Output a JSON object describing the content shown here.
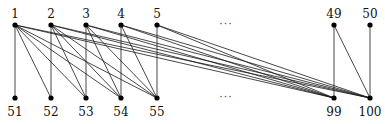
{
  "diagram": {
    "type": "bipartite-graph",
    "colors": {
      "edge": "#1a1a1a",
      "node": "#000000",
      "label": "#111111"
    },
    "node_radius": 2.6,
    "top_row": {
      "label_y": 18,
      "node_y": 25,
      "nodes": [
        {
          "id": "1",
          "label": "1",
          "x": 15
        },
        {
          "id": "2",
          "label": "2",
          "x": 51
        },
        {
          "id": "3",
          "label": "3",
          "x": 86
        },
        {
          "id": "4",
          "label": "4",
          "x": 121
        },
        {
          "id": "5",
          "label": "5",
          "x": 157
        },
        {
          "id": "49",
          "label": "49",
          "x": 334
        },
        {
          "id": "50",
          "label": "50",
          "x": 370
        }
      ]
    },
    "bottom_row": {
      "label_y": 116,
      "node_y": 98,
      "nodes": [
        {
          "id": "51",
          "label": "51",
          "x": 15
        },
        {
          "id": "52",
          "label": "52",
          "x": 51
        },
        {
          "id": "53",
          "label": "53",
          "x": 86
        },
        {
          "id": "54",
          "label": "54",
          "x": 121
        },
        {
          "id": "55",
          "label": "55",
          "x": 157
        },
        {
          "id": "99",
          "label": "99",
          "x": 334
        },
        {
          "id": "100",
          "label": "100",
          "x": 370
        }
      ]
    },
    "ellipses": [
      {
        "text": "···",
        "x": 226,
        "y": 28
      },
      {
        "text": "···",
        "x": 226,
        "y": 101
      }
    ],
    "edges": [
      [
        "1",
        "51"
      ],
      [
        "1",
        "52"
      ],
      [
        "1",
        "53"
      ],
      [
        "1",
        "54"
      ],
      [
        "1",
        "55"
      ],
      [
        "1",
        "99"
      ],
      [
        "1",
        "100"
      ],
      [
        "2",
        "52"
      ],
      [
        "2",
        "53"
      ],
      [
        "2",
        "54"
      ],
      [
        "2",
        "55"
      ],
      [
        "2",
        "99"
      ],
      [
        "2",
        "100"
      ],
      [
        "3",
        "53"
      ],
      [
        "3",
        "54"
      ],
      [
        "3",
        "55"
      ],
      [
        "3",
        "99"
      ],
      [
        "3",
        "100"
      ],
      [
        "4",
        "54"
      ],
      [
        "4",
        "55"
      ],
      [
        "4",
        "99"
      ],
      [
        "4",
        "100"
      ],
      [
        "5",
        "55"
      ],
      [
        "5",
        "99"
      ],
      [
        "5",
        "100"
      ],
      [
        "49",
        "99"
      ],
      [
        "49",
        "100"
      ],
      [
        "50",
        "100"
      ]
    ]
  }
}
